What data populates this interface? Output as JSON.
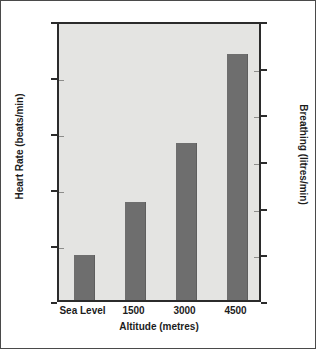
{
  "chart_data": {
    "type": "bar",
    "title": "",
    "categories": [
      "Sea Level",
      "1500",
      "3000",
      "4500"
    ],
    "values": [
      128,
      137.5,
      148,
      164
    ],
    "series": [
      {
        "name": "Heart Rate",
        "values": [
          128,
          137.5,
          148,
          164
        ]
      }
    ],
    "xlabel": "Altitude (metres)",
    "ylabel": "Heart Rate (beats/min)",
    "ylabel_right": "Breathing (litres/min)",
    "ylim": [
      120,
      170
    ],
    "ylim_right": [
      30,
      90
    ],
    "yticks": [
      120,
      130,
      140,
      150,
      160,
      170
    ],
    "yticks_right": [
      30,
      40,
      50,
      60,
      70,
      80,
      90
    ],
    "grid": false,
    "legend": "none",
    "bar_color": "#6e6e6e",
    "plot_background": "#e4e4e2",
    "axis_color": "#2b2b2b",
    "figure_background": "#ffffff"
  },
  "axes": {
    "left": {
      "title": "Heart Rate (beats/min)",
      "ticks": [
        "120",
        "130",
        "140",
        "150",
        "160",
        "170"
      ]
    },
    "right": {
      "title": "Breathing (litres/min)",
      "ticks": [
        "30",
        "40",
        "50",
        "60",
        "70",
        "80",
        "90"
      ]
    },
    "bottom": {
      "title": "Altitude (metres)",
      "ticks": [
        "Sea Level",
        "1500",
        "3000",
        "4500"
      ]
    }
  }
}
